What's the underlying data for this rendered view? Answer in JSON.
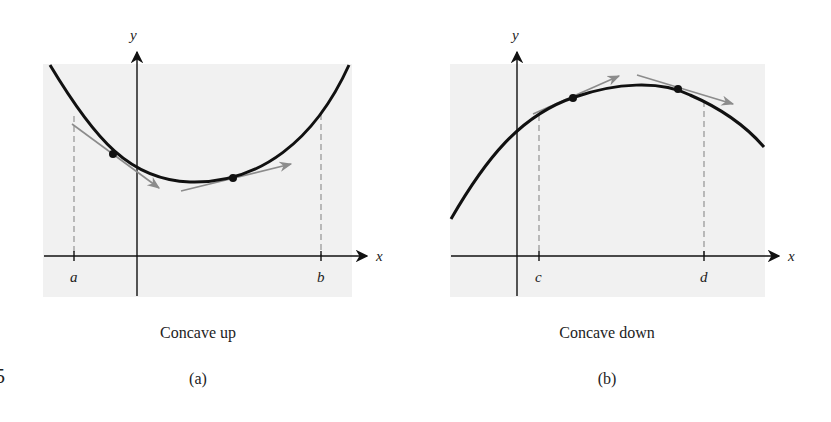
{
  "figure": {
    "edge_fragment": "5",
    "panels": [
      {
        "id": "a",
        "caption": "Concave up",
        "sublabel": "(a)",
        "x_axis_label": "x",
        "y_axis_label": "y",
        "interval_labels": [
          "a",
          "b"
        ],
        "concavity": "up",
        "tangent_position": "below curve"
      },
      {
        "id": "b",
        "caption": "Concave down",
        "sublabel": "(b)",
        "x_axis_label": "x",
        "y_axis_label": "y",
        "interval_labels": [
          "c",
          "d"
        ],
        "concavity": "down",
        "tangent_position": "above curve"
      }
    ]
  },
  "colors": {
    "panel_background": "#f1f1f1",
    "curve": "#111111",
    "axis": "#111111",
    "tangent": "#8c8c8c",
    "dashed_guide": "#8a8a8a"
  }
}
